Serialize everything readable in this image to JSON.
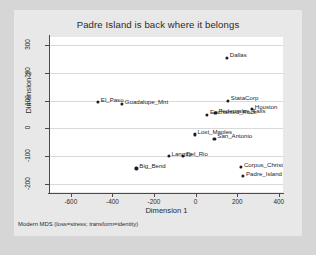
{
  "chart_data": {
    "type": "scatter",
    "title": "Padre Island is back where it belongs",
    "xlabel": "Dimension 1",
    "ylabel": "Dimension 2",
    "xlim": [
      -700,
      420
    ],
    "ylim": [
      -230,
      330
    ],
    "xticks": [
      -600,
      -400,
      -200,
      0,
      200,
      400
    ],
    "yticks": [
      -200,
      -100,
      0,
      100,
      200,
      300
    ],
    "xtick_labels": [
      "-600",
      "-400",
      "-200",
      "0",
      "200",
      "400"
    ],
    "ytick_labels": [
      "-200",
      "-100",
      "0",
      "100",
      "200",
      "300"
    ],
    "grid": "horizontal",
    "legend": "none",
    "footnote": "Modern MDS (loss=stress; transform=identity)",
    "marker_color": "#1d1d1d",
    "plot_background": "#ffffff",
    "figure_background": "#e8e8e8",
    "points": [
      {
        "label": "Dallas",
        "x": 150,
        "y": 255
      },
      {
        "label": "StataCorp",
        "x": 155,
        "y": 100
      },
      {
        "label": "Houston",
        "x": 270,
        "y": 70
      },
      {
        "label": "El_Paso",
        "x": -470,
        "y": 95
      },
      {
        "label": "Guadalupe_Mnt",
        "x": -355,
        "y": 88
      },
      {
        "label": "Pedernales_Falls",
        "x": 95,
        "y": 55
      },
      {
        "label": "Enchanted_Rock",
        "x": 55,
        "y": 50
      },
      {
        "label": "Lost_Maples",
        "x": -5,
        "y": -22
      },
      {
        "label": "San_Antonio",
        "x": 90,
        "y": -38
      },
      {
        "label": "Langtry",
        "x": -130,
        "y": -100
      },
      {
        "label": "Del_Rio",
        "x": -60,
        "y": -100
      },
      {
        "label": "Big_Bend",
        "x": -285,
        "y": -145
      },
      {
        "label": "Corpus_Christi",
        "x": 218,
        "y": -140
      },
      {
        "label": "Padre_Island",
        "x": 228,
        "y": -172
      }
    ]
  }
}
